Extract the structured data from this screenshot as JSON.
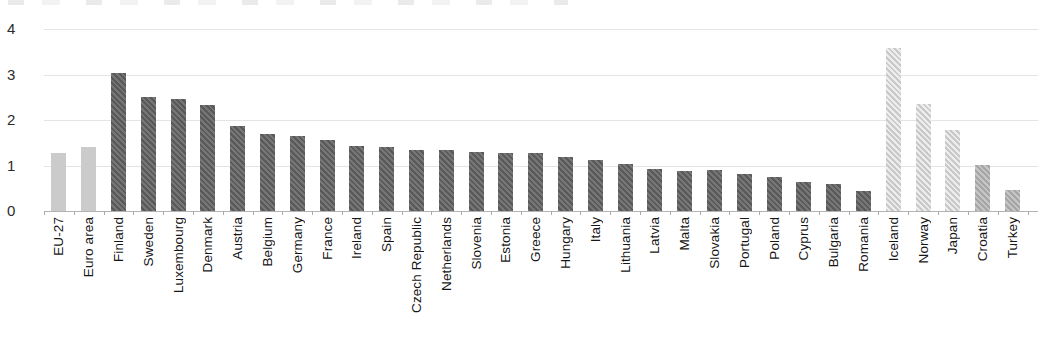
{
  "chart_data": {
    "type": "bar",
    "title": "",
    "xlabel": "",
    "ylabel": "",
    "ylim": [
      0,
      4
    ],
    "yticks": [
      0,
      1,
      2,
      3,
      4
    ],
    "grid": true,
    "legend": null,
    "bars": [
      {
        "label": "EU-27",
        "value": 1.27,
        "style": "aggregate"
      },
      {
        "label": "Euro area",
        "value": 1.41,
        "style": "aggregate"
      },
      {
        "label": "Finland",
        "value": 3.03,
        "style": "member"
      },
      {
        "label": "Sweden",
        "value": 2.5,
        "style": "member"
      },
      {
        "label": "Luxembourg",
        "value": 2.46,
        "style": "member"
      },
      {
        "label": "Denmark",
        "value": 2.32,
        "style": "member"
      },
      {
        "label": "Austria",
        "value": 1.86,
        "style": "member"
      },
      {
        "label": "Belgium",
        "value": 1.69,
        "style": "member"
      },
      {
        "label": "Germany",
        "value": 1.64,
        "style": "member"
      },
      {
        "label": "France",
        "value": 1.56,
        "style": "member"
      },
      {
        "label": "Ireland",
        "value": 1.43,
        "style": "member"
      },
      {
        "label": "Spain",
        "value": 1.41,
        "style": "member"
      },
      {
        "label": "Czech Republic",
        "value": 1.34,
        "style": "member"
      },
      {
        "label": "Netherlands",
        "value": 1.34,
        "style": "member"
      },
      {
        "label": "Slovenia",
        "value": 1.3,
        "style": "member"
      },
      {
        "label": "Estonia",
        "value": 1.28,
        "style": "member"
      },
      {
        "label": "Greece",
        "value": 1.28,
        "style": "member"
      },
      {
        "label": "Hungary",
        "value": 1.19,
        "style": "member"
      },
      {
        "label": "Italy",
        "value": 1.12,
        "style": "member"
      },
      {
        "label": "Lithuania",
        "value": 1.04,
        "style": "member"
      },
      {
        "label": "Latvia",
        "value": 0.93,
        "style": "member"
      },
      {
        "label": "Malta",
        "value": 0.87,
        "style": "member"
      },
      {
        "label": "Slovakia",
        "value": 0.9,
        "style": "member"
      },
      {
        "label": "Portugal",
        "value": 0.81,
        "style": "member"
      },
      {
        "label": "Poland",
        "value": 0.74,
        "style": "member"
      },
      {
        "label": "Cyprus",
        "value": 0.64,
        "style": "member"
      },
      {
        "label": "Bulgaria",
        "value": 0.6,
        "style": "member"
      },
      {
        "label": "Romania",
        "value": 0.44,
        "style": "member"
      },
      {
        "label": "Iceland",
        "value": 3.58,
        "style": "other_country"
      },
      {
        "label": "Norway",
        "value": 2.35,
        "style": "other_country"
      },
      {
        "label": "Japan",
        "value": 1.77,
        "style": "other_country"
      },
      {
        "label": "Croatia",
        "value": 1.01,
        "style": "candidate"
      },
      {
        "label": "Turkey",
        "value": 0.46,
        "style": "candidate"
      }
    ],
    "bar_styles": {
      "aggregate": {
        "fill": "#cbcbcb",
        "hatch": false,
        "stripe": null
      },
      "member": {
        "fill": "#767676",
        "hatch": true,
        "stripe": "#595959"
      },
      "other_country": {
        "fill": "#c9c9c9",
        "hatch": true,
        "stripe": "#ededed"
      },
      "candidate": {
        "fill": "#a6a6a6",
        "hatch": true,
        "stripe": "#c6c6c6"
      }
    },
    "layout_colors": {
      "gridline": "#e4e4e4",
      "axis_baseline": "#b3b3b3",
      "axis_tick": "#aaaaaa",
      "y_label_text": "#2b2b2b",
      "x_label_text": "#161616",
      "background": "#ffffff"
    }
  }
}
